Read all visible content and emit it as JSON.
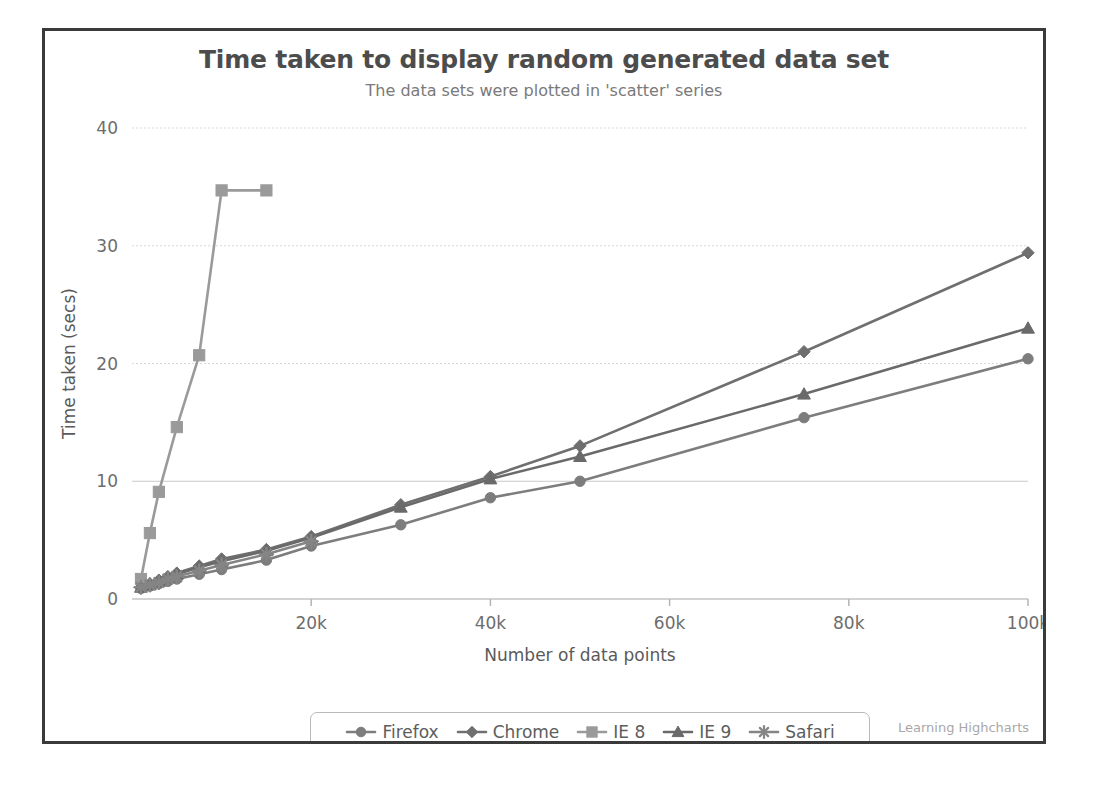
{
  "chart_data": {
    "type": "line",
    "title": "Time taken to display random generated data set",
    "subtitle": "The data sets were plotted in 'scatter' series",
    "xlabel": "Number of data points",
    "ylabel": "Time taken (secs)",
    "xlim": [
      0,
      100000
    ],
    "ylim": [
      0,
      40
    ],
    "xticks": [
      20000,
      40000,
      60000,
      80000,
      100000
    ],
    "xtick_labels": [
      "20k",
      "40k",
      "60k",
      "80k",
      "100k"
    ],
    "yticks": [
      0,
      10,
      20,
      30,
      40
    ],
    "ytick_labels": [
      "0",
      "10",
      "20",
      "30",
      "40"
    ],
    "grid": true,
    "legend_position": "bottom",
    "watermark": "Learning Highcharts",
    "x": [
      1000,
      2000,
      3000,
      4000,
      5000,
      7500,
      10000,
      15000,
      20000,
      30000,
      40000,
      50000,
      75000,
      100000
    ],
    "series": [
      {
        "name": "Firefox",
        "marker": "circle",
        "color": "#7d7d7d",
        "x": [
          1000,
          2000,
          3000,
          4000,
          5000,
          7500,
          10000,
          15000,
          20000,
          30000,
          40000,
          50000,
          75000,
          100000
        ],
        "values": [
          0.9,
          1.1,
          1.3,
          1.5,
          1.7,
          2.1,
          2.5,
          3.3,
          4.5,
          6.3,
          8.6,
          10.0,
          15.4,
          20.4
        ]
      },
      {
        "name": "Chrome",
        "marker": "diamond",
        "color": "#6f6f6f",
        "x": [
          1000,
          2000,
          3000,
          4000,
          5000,
          7500,
          10000,
          15000,
          20000,
          30000,
          40000,
          50000,
          75000,
          100000
        ],
        "values": [
          1.0,
          1.3,
          1.6,
          1.9,
          2.2,
          2.8,
          3.4,
          4.2,
          5.3,
          8.0,
          10.4,
          13.0,
          21.0,
          29.4
        ]
      },
      {
        "name": "IE 8",
        "marker": "square",
        "color": "#9a9a9a",
        "x": [
          1000,
          2000,
          3000,
          5000,
          7500,
          10000,
          15000
        ],
        "values": [
          1.7,
          5.6,
          9.1,
          14.6,
          20.7,
          34.7,
          34.7
        ]
      },
      {
        "name": "IE 9",
        "marker": "triangle",
        "color": "#6a6a6a",
        "x": [
          1000,
          2000,
          3000,
          4000,
          5000,
          7500,
          10000,
          15000,
          20000,
          30000,
          40000,
          50000,
          75000,
          100000
        ],
        "values": [
          1.0,
          1.2,
          1.5,
          1.8,
          2.1,
          2.7,
          3.2,
          4.1,
          5.2,
          7.8,
          10.2,
          12.1,
          17.4,
          23.0
        ]
      },
      {
        "name": "Safari",
        "marker": "star",
        "color": "#858585",
        "x": [
          1000,
          2000,
          3000,
          4000,
          5000,
          7500,
          10000,
          15000,
          20000
        ],
        "values": [
          1.0,
          1.2,
          1.4,
          1.7,
          1.9,
          2.4,
          2.9,
          3.8,
          4.9
        ]
      }
    ]
  },
  "legend": {
    "items": [
      {
        "label": "Firefox",
        "marker": "circle"
      },
      {
        "label": "Chrome",
        "marker": "diamond"
      },
      {
        "label": "IE 8",
        "marker": "square"
      },
      {
        "label": "IE 9",
        "marker": "triangle"
      },
      {
        "label": "Safari",
        "marker": "star"
      }
    ]
  },
  "colors": {
    "title": "#4c4c4c",
    "subtitle": "#7a7a7a",
    "axis_text": "#6d6d6d",
    "grid": "#d8d8d8",
    "border": "#3a3a3a",
    "watermark": "#a8a8a8",
    "background": "#ffffff"
  }
}
